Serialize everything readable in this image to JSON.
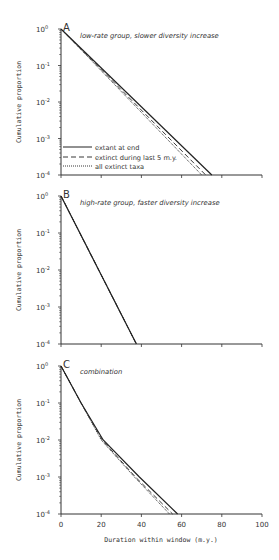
{
  "chart_data": [
    {
      "type": "line",
      "panel": "A",
      "title": "low-rate group, slower diversity increase",
      "xlabel": "",
      "ylabel": "Cumulative proportion",
      "xlim": [
        0,
        100
      ],
      "ylim": [
        0.0001,
        1
      ],
      "yscale": "log",
      "yticks": [
        "10^0",
        "10^-1",
        "10^-2",
        "10^-3",
        "10^-4"
      ],
      "legend_position": "lower left",
      "series": [
        {
          "name": "extant at end",
          "style": "solid",
          "x": [
            0,
            75
          ],
          "y": [
            1,
            0.0001
          ]
        },
        {
          "name": "extinct during last 5 m.y.",
          "style": "dashed",
          "x": [
            0,
            72
          ],
          "y": [
            1,
            0.0001
          ]
        },
        {
          "name": "all extinct taxa",
          "style": "dotted",
          "x": [
            0,
            70
          ],
          "y": [
            1,
            0.0001
          ]
        }
      ]
    },
    {
      "type": "line",
      "panel": "B",
      "title": "high-rate group, faster diversity increase",
      "xlabel": "",
      "ylabel": "Cumulative proportion",
      "xlim": [
        0,
        100
      ],
      "ylim": [
        0.0001,
        1
      ],
      "yscale": "log",
      "yticks": [
        "10^0",
        "10^-1",
        "10^-2",
        "10^-3",
        "10^-4"
      ],
      "series": [
        {
          "name": "extant at end",
          "style": "solid",
          "x": [
            0,
            37.5
          ],
          "y": [
            1,
            0.0001
          ]
        },
        {
          "name": "extinct during last 5 m.y.",
          "style": "dashed",
          "x": [
            0,
            37.5
          ],
          "y": [
            1,
            0.0001
          ]
        },
        {
          "name": "all extinct taxa",
          "style": "dotted",
          "x": [
            0,
            37.5
          ],
          "y": [
            1,
            0.0001
          ]
        }
      ]
    },
    {
      "type": "line",
      "panel": "C",
      "title": "combination",
      "xlabel": "Duration within window (m.y.)",
      "ylabel": "Cumulative proportion",
      "xlim": [
        0,
        100
      ],
      "xticks": [
        0,
        20,
        40,
        60,
        80,
        100
      ],
      "ylim": [
        0.0001,
        1
      ],
      "yscale": "log",
      "yticks": [
        "10^0",
        "10^-1",
        "10^-2",
        "10^-3",
        "10^-4"
      ],
      "series": [
        {
          "name": "extant at end",
          "style": "solid",
          "x": [
            0,
            10,
            21,
            39,
            58
          ],
          "y": [
            1,
            0.1,
            0.01,
            0.001,
            0.0001
          ]
        },
        {
          "name": "extinct during last 5 m.y.",
          "style": "dashed",
          "x": [
            0,
            10,
            20.5,
            37,
            55.5
          ],
          "y": [
            1,
            0.1,
            0.01,
            0.001,
            0.0001
          ]
        },
        {
          "name": "all extinct taxa",
          "style": "dotted",
          "x": [
            0,
            10,
            20,
            36.5,
            54
          ],
          "y": [
            1,
            0.1,
            0.01,
            0.001,
            0.0001
          ]
        }
      ]
    }
  ],
  "layout": {
    "x0_px": 61,
    "x100_px": 262,
    "panels": [
      {
        "top_px": 29,
        "bottom_px": 175
      },
      {
        "top_px": 196,
        "bottom_px": 344
      },
      {
        "top_px": 366,
        "bottom_px": 514
      }
    ]
  },
  "text": {
    "panel_a_letter": "A",
    "panel_b_letter": "B",
    "panel_c_letter": "C",
    "panel_a_title": "low-rate group, slower diversity increase",
    "panel_b_title": "high-rate group, faster diversity increase",
    "panel_c_title": "combination",
    "ylabel": "Cumulative proportion",
    "xlabel": "Duration within window (m.y.)",
    "legend": [
      "extant at end",
      "extinct during last 5 m.y.",
      "all extinct taxa"
    ],
    "xtick_labels": [
      "0",
      "20",
      "40",
      "60",
      "80",
      "100"
    ]
  },
  "colors": {
    "line": "#222222",
    "axis": "#333333",
    "text": "#333333"
  }
}
